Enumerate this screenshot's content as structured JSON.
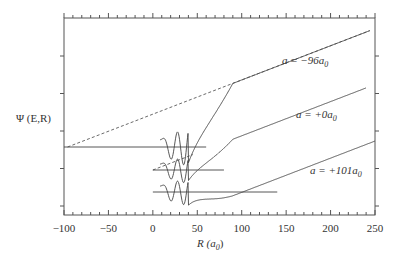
{
  "chart_data": {
    "type": "line",
    "title": "",
    "xlabel": "R (a0)",
    "ylabel": "Ψ (E,R)",
    "xlim": [
      -100,
      250
    ],
    "x_ticks": [
      -100,
      -50,
      0,
      50,
      100,
      150,
      200,
      250
    ],
    "x_tick_labels": [
      "−100",
      "−50",
      "0",
      "50",
      "100",
      "150",
      "200",
      "250"
    ],
    "x_minor_step": 10,
    "y_ticks_count": 5,
    "grid": false,
    "legend": "none",
    "series": [
      {
        "name": "a = −96a0",
        "label_main": "a = −96a",
        "label_sub": "0",
        "scattering_length": -96,
        "baseline_offset": 2,
        "node_x_intercept": -96,
        "wavefunction_end_x": 244,
        "baseline_end_x": 60
      },
      {
        "name": "a = +0a0",
        "label_main": "a = +0a",
        "label_sub": "0",
        "scattering_length": 0,
        "baseline_offset": 1,
        "node_x_intercept": 0,
        "wavefunction_end_x": 240,
        "baseline_end_x": 80
      },
      {
        "name": "a = +101a0",
        "label_main": "a = +101a",
        "label_sub": "0",
        "scattering_length": 101,
        "baseline_offset": 0,
        "node_x_intercept": 101,
        "wavefunction_end_x": 250,
        "baseline_end_x": 140
      }
    ],
    "annotations": [
      "asymptotic linear extrapolations (dashed) intersect baseline at R = a"
    ]
  }
}
